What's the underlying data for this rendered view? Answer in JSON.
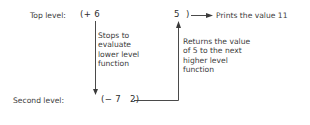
{
  "diagram": {
    "top_level": {
      "label": "Top level:",
      "expr_open": "(+ 6",
      "value": "5",
      "expr_close": ")",
      "output_note": "Prints the value 11"
    },
    "second_level": {
      "label": "Second level:",
      "expr": "(− 7   2)"
    },
    "annotations": {
      "down": [
        "Stops to",
        "evaluate",
        "lower level",
        "function"
      ],
      "up": [
        "Returns the value",
        "of 5 to the next",
        "higher level",
        "function"
      ]
    },
    "colors": {
      "text": "#3c3c3c",
      "line": "#4a4a4a",
      "background": "#ffffff"
    }
  }
}
